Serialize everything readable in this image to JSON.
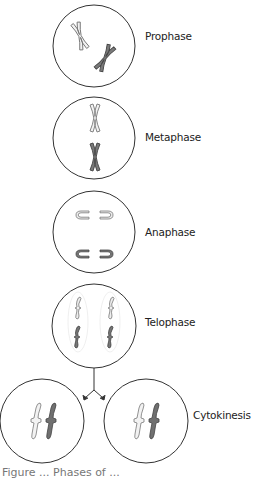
{
  "diagram": {
    "stages": [
      {
        "id": "prophase",
        "label": "Prophase"
      },
      {
        "id": "metaphase",
        "label": "Metaphase"
      },
      {
        "id": "anaphase",
        "label": "Anaphase"
      },
      {
        "id": "telophase",
        "label": "Telophase"
      },
      {
        "id": "cytokinesis",
        "label": "Cytokinesis"
      }
    ],
    "caption": "Figure ... Phases of ...",
    "colors": {
      "cell_outline": "#333333",
      "chromosome_light_fill": "#eeeeee",
      "chromosome_light_stroke": "#777777",
      "chromosome_dark_fill": "#777777",
      "chromosome_dark_stroke": "#444444",
      "arrow": "#333333"
    }
  }
}
